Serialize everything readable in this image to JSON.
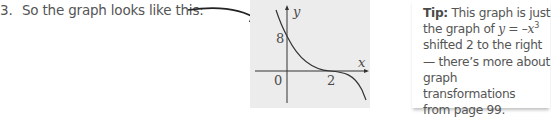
{
  "step": {
    "number": "3.",
    "text": "So the graph looks like this:"
  },
  "graph": {
    "y_axis_label": "y",
    "x_axis_label": "x",
    "y_intercept_label": "8",
    "origin_label": "0",
    "x_root_label": "2",
    "panel_color": "#ececec",
    "curve_description": "y = -(x-2)^3, passing through (0,8) with a point of inflection at (2,0)"
  },
  "tip": {
    "label": "Tip:",
    "line1": " This graph is just",
    "line2_prefix": "the graph of ",
    "equation_lhs": "y",
    "equation_mid": " = –",
    "equation_var": "x",
    "equation_exp": "3",
    "line3": "shifted 2 to the right",
    "line4": "— there’s more about",
    "line5": "graph transformations",
    "line6": "from page 99."
  }
}
